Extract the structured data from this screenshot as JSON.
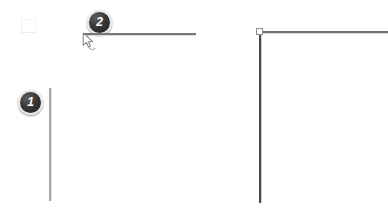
{
  "canvas": {
    "background_color": "#ffffff",
    "width": 388,
    "height": 211
  },
  "annotations": {
    "step_one": {
      "label": "1",
      "icon": "step-badge-icon",
      "x": 18,
      "y": 90,
      "color": "#1d1d1d",
      "text_color": "#ffffff"
    },
    "step_two": {
      "label": "2",
      "icon": "step-badge-icon",
      "x": 87,
      "y": 10,
      "color": "#1d1d1d",
      "text_color": "#ffffff"
    }
  },
  "shapes": {
    "faint_corner_mark": {
      "icon": "faint-corner-mark-icon",
      "x": 21,
      "y": 19,
      "width": 14,
      "height": 13,
      "color": "#ececec"
    },
    "line_top_left": {
      "icon": "horizontal-line-icon",
      "x": 84,
      "y": 33,
      "length": 112,
      "color": "#787878"
    },
    "line_left_vertical": {
      "icon": "vertical-line-icon",
      "x": 49,
      "y": 88,
      "length": 113,
      "color": "#a8a8a8"
    },
    "line_top_right": {
      "icon": "horizontal-line-icon",
      "x": 260,
      "y": 31,
      "length": 128,
      "color": "#6e6e6e"
    },
    "line_right_vertical": {
      "icon": "vertical-line-icon",
      "x": 259,
      "y": 33,
      "length": 170,
      "color": "#4a4a4a"
    },
    "corner_anchor": {
      "icon": "anchor-handle-icon",
      "x": 256,
      "y": 28,
      "size": 7,
      "fill": "#ffffff",
      "stroke": "#8d8d8d"
    }
  },
  "pointer": {
    "icon": "mouse-cursor-icon",
    "x": 82,
    "y": 32,
    "color": "#8a8a8a"
  }
}
